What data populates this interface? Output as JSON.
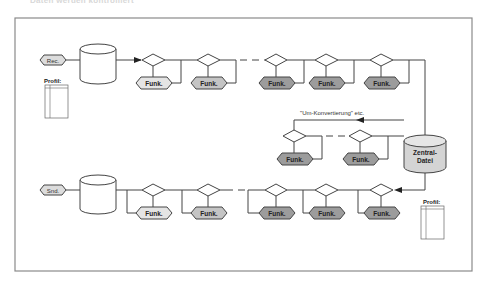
{
  "title_cut": "Daten werden kontrolliert",
  "colors": {
    "frame": "#8a8a8a",
    "line": "#444444",
    "hex_light": "#e4e4e4",
    "hex_mid": "#c4c4c4",
    "hex_dark": "#9c9c9c",
    "central_fill": "#d4d4d4"
  },
  "diagram": {
    "receive_label": "Rec.",
    "send_label": "Snd.",
    "profile_label_in": "Profil:",
    "profile_label_out": "Profil:",
    "central_file_line1": "Zentral-",
    "central_file_line2": "Datei",
    "conversion_note": "\"Um-Konvertierung\" etc.",
    "function_label": "Funk.",
    "top_row_functions": [
      "Funk.",
      "Funk.",
      "Funk.",
      "Funk.",
      "Funk."
    ],
    "middle_row_functions": [
      "Funk.",
      "Funk."
    ],
    "bottom_row_functions": [
      "Funk.",
      "Funk.",
      "Funk.",
      "Funk.",
      "Funk."
    ]
  }
}
